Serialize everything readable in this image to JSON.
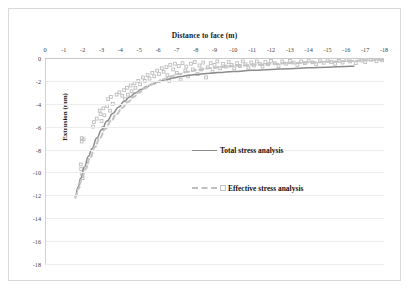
{
  "chart_data": {
    "type": "line",
    "title": "Distance to face (m)",
    "xlabel": "Distance to face (m)",
    "ylabel": "Extrusion (mm)",
    "xlim": [
      0,
      -18
    ],
    "ylim": [
      -18,
      0
    ],
    "grid": true,
    "legend_position": "center",
    "xticks": [
      "0",
      "-1",
      "-2",
      "-3",
      "-4",
      "-5",
      "-6",
      "-7",
      "-8",
      "-9",
      "-10",
      "-11",
      "-12",
      "-13",
      "-14",
      "-15",
      "-16",
      "-17",
      "-18"
    ],
    "yticks": [
      "0",
      "-2",
      "-4",
      "-6",
      "-8",
      "-10",
      "-12",
      "-14",
      "-16",
      "-18"
    ],
    "series": [
      {
        "name": "Total stress analysis",
        "style": "solid",
        "color": "#8b8b8b",
        "x": [
          -1.62,
          -1.75,
          -1.9,
          -2.1,
          -2.3,
          -2.5,
          -2.75,
          -3.0,
          -3.3,
          -3.6,
          -3.9,
          -4.2,
          -4.5,
          -4.8,
          -5.1,
          -5.4,
          -5.7,
          -6.0,
          -6.4,
          -6.8,
          -7.2,
          -7.6,
          -8.0,
          -8.6,
          -9.2,
          -10.0,
          -11.0,
          -12.0,
          -13.0,
          -14.0,
          -15.0,
          -16.0,
          -16.4
        ],
        "y": [
          -12.1,
          -11.3,
          -10.5,
          -9.5,
          -8.6,
          -7.9,
          -7.0,
          -6.3,
          -5.5,
          -4.85,
          -4.3,
          -3.8,
          -3.4,
          -3.05,
          -2.75,
          -2.5,
          -2.3,
          -2.1,
          -1.9,
          -1.75,
          -1.62,
          -1.52,
          -1.45,
          -1.35,
          -1.27,
          -1.18,
          -1.08,
          -1.0,
          -0.93,
          -0.86,
          -0.8,
          -0.74,
          -0.72
        ]
      },
      {
        "name": "Effective stress analysis",
        "style": "dashed",
        "color": "#c4c4c4",
        "x": [
          -1.6,
          -1.78,
          -1.95,
          -2.15,
          -2.4,
          -2.65,
          -2.9,
          -3.2,
          -3.5,
          -3.8,
          -4.1,
          -4.4,
          -4.7,
          -5.0,
          -5.3,
          -5.6,
          -5.9,
          -6.3,
          -6.7,
          -7.1,
          -7.6,
          -8.1,
          -8.7,
          -9.4,
          -10.2,
          -11.2,
          -12.2,
          -13.2,
          -14.2,
          -15.2,
          -16.2,
          -17.2,
          -18.0
        ],
        "y": [
          -12.2,
          -11.4,
          -10.6,
          -9.7,
          -8.7,
          -7.8,
          -7.0,
          -6.2,
          -5.5,
          -4.9,
          -4.35,
          -3.85,
          -3.4,
          -3.0,
          -2.65,
          -2.35,
          -2.1,
          -1.85,
          -1.6,
          -1.4,
          -1.2,
          -1.05,
          -0.9,
          -0.78,
          -0.68,
          -0.58,
          -0.5,
          -0.44,
          -0.38,
          -0.32,
          -0.26,
          -0.2,
          -0.15
        ]
      }
    ],
    "scatter": {
      "name": "Measured extrusion data",
      "color": "#bdbdbd",
      "points": [
        [
          -1.95,
          -7.0
        ],
        [
          -1.95,
          -7.3
        ],
        [
          -2.05,
          -7.1
        ],
        [
          -1.9,
          -9.3
        ],
        [
          -1.92,
          -9.7
        ],
        [
          -1.95,
          -10.1
        ],
        [
          -2.0,
          -10.5
        ],
        [
          -2.6,
          -5.6
        ],
        [
          -2.75,
          -5.3
        ],
        [
          -2.55,
          -6.0
        ],
        [
          -2.9,
          -4.6
        ],
        [
          -2.95,
          -4.9
        ],
        [
          -3.1,
          -4.4
        ],
        [
          -3.15,
          -5.0
        ],
        [
          -3.0,
          -5.5
        ],
        [
          -3.1,
          -6.1
        ],
        [
          -3.35,
          -3.6
        ],
        [
          -3.5,
          -3.4
        ],
        [
          -3.3,
          -4.2
        ],
        [
          -3.6,
          -4.0
        ],
        [
          -3.45,
          -4.6
        ],
        [
          -3.8,
          -3.2
        ],
        [
          -3.95,
          -3.0
        ],
        [
          -4.1,
          -3.3
        ],
        [
          -4.2,
          -2.8
        ],
        [
          -4.35,
          -2.6
        ],
        [
          -4.25,
          -3.6
        ],
        [
          -4.4,
          -3.2
        ],
        [
          -4.55,
          -2.4
        ],
        [
          -4.6,
          -2.9
        ],
        [
          -4.75,
          -2.2
        ],
        [
          -4.8,
          -2.6
        ],
        [
          -4.95,
          -2.0
        ],
        [
          -5.05,
          -2.3
        ],
        [
          -5.2,
          -1.7
        ],
        [
          -5.3,
          -2.0
        ],
        [
          -5.45,
          -1.5
        ],
        [
          -5.55,
          -1.8
        ],
        [
          -5.7,
          -1.3
        ],
        [
          -5.8,
          -1.6
        ],
        [
          -5.95,
          -1.1
        ],
        [
          -6.05,
          -1.4
        ],
        [
          -6.2,
          -0.9
        ],
        [
          -6.3,
          -1.2
        ],
        [
          -6.45,
          -0.8
        ],
        [
          -6.5,
          -1.5
        ],
        [
          -6.6,
          -2.0
        ],
        [
          -6.65,
          -0.6
        ],
        [
          -6.8,
          -1.0
        ],
        [
          -6.9,
          -0.5
        ],
        [
          -7.0,
          -1.3
        ],
        [
          -7.1,
          -0.7
        ],
        [
          -7.2,
          -1.9
        ],
        [
          -7.3,
          -0.45
        ],
        [
          -7.45,
          -1.1
        ],
        [
          -7.5,
          -0.75
        ],
        [
          -7.6,
          -1.6
        ],
        [
          -7.75,
          -0.5
        ],
        [
          -7.85,
          -1.0
        ],
        [
          -7.95,
          -0.35
        ],
        [
          -8.1,
          -1.4
        ],
        [
          -8.2,
          -0.65
        ],
        [
          -8.3,
          -1.0
        ],
        [
          -8.4,
          -0.4
        ],
        [
          -8.55,
          -1.7
        ],
        [
          -8.65,
          -0.8
        ],
        [
          -8.8,
          -0.45
        ],
        [
          -8.9,
          -1.2
        ],
        [
          -9.0,
          -0.6
        ],
        [
          -9.15,
          -0.3
        ],
        [
          -9.3,
          -0.9
        ],
        [
          -9.45,
          -0.5
        ],
        [
          -9.6,
          -0.75
        ],
        [
          -9.75,
          -0.35
        ],
        [
          -9.9,
          -0.6
        ],
        [
          -10.05,
          -0.9
        ],
        [
          -10.2,
          -0.45
        ],
        [
          -10.35,
          -0.7
        ],
        [
          -10.5,
          -0.3
        ],
        [
          -10.65,
          -0.55
        ],
        [
          -10.8,
          -0.85
        ],
        [
          -10.95,
          -0.4
        ],
        [
          -11.1,
          -0.65
        ],
        [
          -11.25,
          -0.3
        ],
        [
          -11.4,
          -0.5
        ],
        [
          -11.55,
          -0.75
        ],
        [
          -11.7,
          -0.35
        ],
        [
          -11.85,
          -0.55
        ],
        [
          -12.0,
          -0.25
        ],
        [
          -12.2,
          -0.45
        ],
        [
          -12.4,
          -0.7
        ],
        [
          -12.6,
          -0.3
        ],
        [
          -12.8,
          -0.5
        ],
        [
          -13.0,
          -0.25
        ],
        [
          -13.2,
          -0.4
        ],
        [
          -13.4,
          -0.6
        ],
        [
          -13.6,
          -0.3
        ],
        [
          -13.8,
          -0.45
        ],
        [
          -14.0,
          -0.22
        ],
        [
          -14.2,
          -0.38
        ],
        [
          -14.4,
          -0.55
        ],
        [
          -14.6,
          -0.28
        ],
        [
          -14.8,
          -0.42
        ],
        [
          -15.0,
          -0.2
        ],
        [
          -15.2,
          -0.35
        ],
        [
          -15.4,
          -0.5
        ],
        [
          -15.6,
          -0.25
        ],
        [
          -15.8,
          -0.4
        ],
        [
          -16.0,
          -0.18
        ],
        [
          -16.2,
          -0.3
        ],
        [
          -16.5,
          -0.45
        ],
        [
          -16.8,
          -0.22
        ],
        [
          -17.0,
          -0.35
        ],
        [
          -17.3,
          -0.15
        ],
        [
          -17.6,
          -0.28
        ],
        [
          -17.9,
          -0.2
        ]
      ]
    }
  }
}
